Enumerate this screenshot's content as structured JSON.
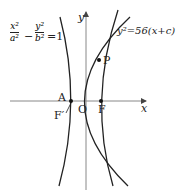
{
  "diagram": {
    "equation_hyperbola": {
      "num1": "x²",
      "den1": "a²",
      "minus": "−",
      "num2": "y²",
      "den2": "b²",
      "equals": "=1"
    },
    "equation_parabola": "y²=56(x+c)",
    "labels": {
      "x_axis": "x",
      "y_axis": "y",
      "origin": "O",
      "point_A": "A",
      "point_F": "F",
      "point_F_prime": "F′",
      "point_P": "P"
    },
    "colors": {
      "curve": "#222222",
      "axis": "#888888"
    }
  }
}
